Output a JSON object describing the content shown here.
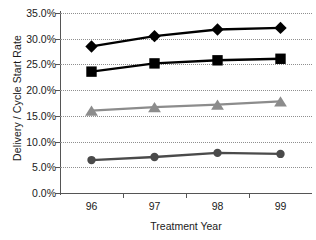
{
  "chart_data": {
    "type": "line",
    "title": "",
    "xlabel": "Treatment Year",
    "ylabel": "Delivery / Cycle Start Rate",
    "categories": [
      "96",
      "97",
      "98",
      "99"
    ],
    "x": [
      96,
      97,
      98,
      99
    ],
    "ylim": [
      0,
      0.35
    ],
    "y_tick_labels": [
      "35.0%",
      "30.0%",
      "25.0%",
      "20.0%",
      "15.0%",
      "10.0%",
      "5.0%",
      "0.0%"
    ],
    "y_tick_values": [
      0.35,
      0.3,
      0.25,
      0.2,
      0.15,
      0.1,
      0.05,
      0.0
    ],
    "grid": true,
    "legend": "none",
    "series": [
      {
        "name": "diamond-series",
        "marker": "diamond",
        "color": "#000000",
        "values": [
          0.285,
          0.305,
          0.318,
          0.321
        ]
      },
      {
        "name": "square-series",
        "marker": "square",
        "color": "#000000",
        "values": [
          0.236,
          0.252,
          0.258,
          0.261
        ]
      },
      {
        "name": "triangle-series",
        "marker": "triangle",
        "color": "#8c8c8c",
        "values": [
          0.16,
          0.167,
          0.172,
          0.178
        ]
      },
      {
        "name": "circle-series",
        "marker": "circle",
        "color": "#4a4a4a",
        "values": [
          0.064,
          0.07,
          0.078,
          0.076
        ]
      }
    ]
  },
  "axes": {
    "y_title": "Delivery / Cycle Start Rate",
    "x_title": "Treatment Year"
  }
}
